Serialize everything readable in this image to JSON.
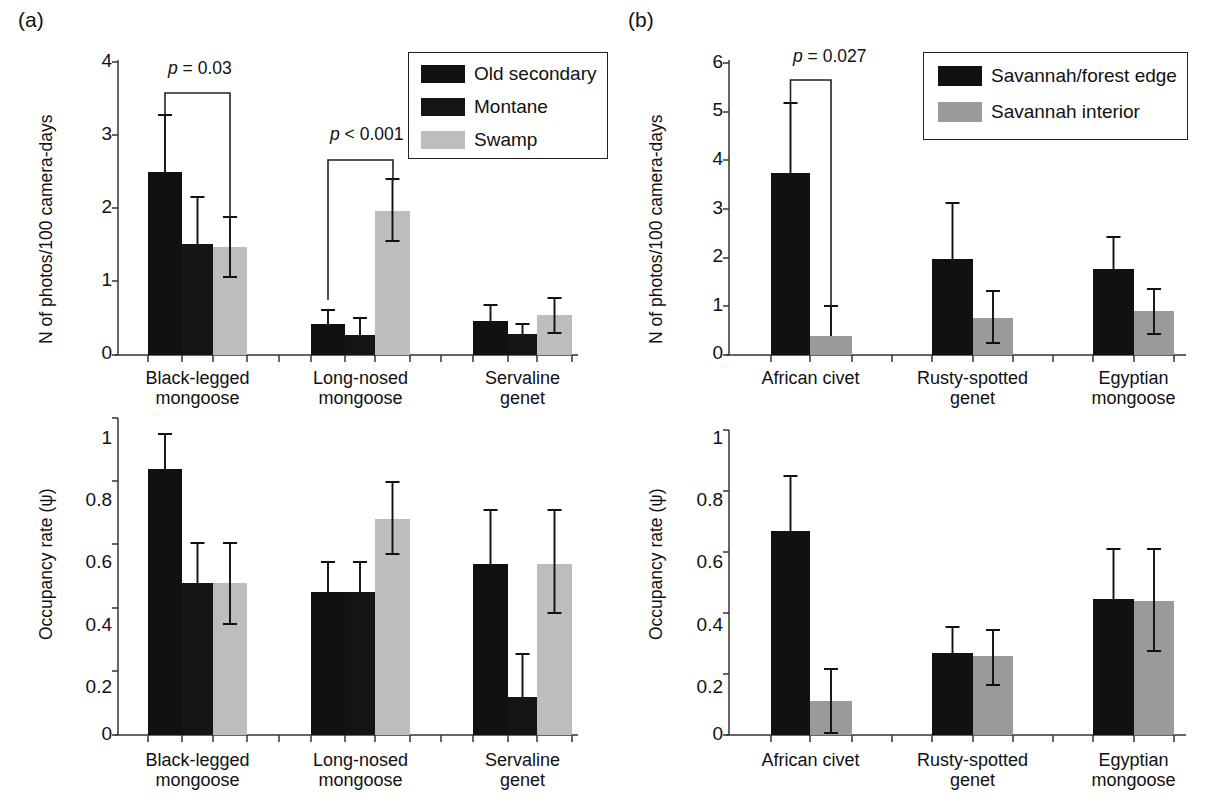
{
  "figure": {
    "panel_a_tag": "(a)",
    "panel_b_tag": "(b)",
    "axis_title_counts": "N of photos/100 camera-days",
    "axis_title_occupancy": "Occupancy rate (ψ)"
  },
  "legend_a": {
    "items": [
      {
        "label": "Old secondary",
        "color": "#111111"
      },
      {
        "label": "Montane",
        "color": "#151515"
      },
      {
        "label": "Swamp",
        "color": "#bdbdbd"
      }
    ]
  },
  "legend_b": {
    "items": [
      {
        "label": "Savannah/forest edge",
        "color": "#111111"
      },
      {
        "label": "Savannah interior",
        "color": "#9a9a9a"
      }
    ]
  },
  "annotations": {
    "a_top_p1_prefix": "p",
    "a_top_p1": "p = 0.03",
    "a_top_p2": "p < 0.001",
    "b_top_p1": "p = 0.027"
  },
  "ticks": {
    "a_top": [
      "0",
      "1",
      "2",
      "3",
      "4"
    ],
    "a_bottom": [
      "0",
      "0.2",
      "0.4",
      "0.6",
      "0.8",
      "1"
    ],
    "b_top": [
      "0",
      "1",
      "2",
      "3",
      "4",
      "5",
      "6"
    ],
    "b_bottom": [
      "0",
      "0.2",
      "0.4",
      "0.6",
      "0.8",
      "1"
    ]
  },
  "categories_a": [
    "Black-legged\nmongoose",
    "Long-nosed\nmongoose",
    "Servaline\ngenet"
  ],
  "categories_b": [
    "African civet",
    "Rusty-spotted\ngenet",
    "Egyptian\nmongoose"
  ],
  "chart_data": [
    {
      "id": "a-top",
      "type": "bar",
      "title": "(a) Photographic rate by forest habitat",
      "xlabel": "",
      "ylabel": "N of photos/100 camera-days",
      "ylim": [
        0,
        4
      ],
      "yticks": [
        0,
        1,
        2,
        3,
        4
      ],
      "grid": false,
      "legend_position": "top-right",
      "categories": [
        "Black-legged mongoose",
        "Long-nosed mongoose",
        "Servaline genet"
      ],
      "series": [
        {
          "name": "Old secondary",
          "color": "#111111",
          "values": [
            2.5,
            0.42,
            0.47
          ],
          "err_low": [
            2.5,
            0.42,
            0.47
          ],
          "err_high": [
            3.28,
            0.62,
            0.68
          ]
        },
        {
          "name": "Montane",
          "color": "#151515",
          "values": [
            1.52,
            0.27,
            0.28
          ],
          "err_low": [
            1.52,
            0.27,
            0.28
          ],
          "err_high": [
            2.15,
            0.51,
            0.42
          ]
        },
        {
          "name": "Swamp",
          "color": "#bdbdbd",
          "values": [
            1.47,
            1.97,
            0.55
          ],
          "err_low": [
            1.11,
            1.56,
            0.3
          ],
          "err_high": [
            1.89,
            2.4,
            0.78
          ]
        }
      ],
      "annotations": [
        {
          "text": "p = 0.03",
          "from": "Black-legged mongoose/Old secondary",
          "to": "Black-legged mongoose/Swamp"
        },
        {
          "text": "p < 0.001",
          "from": "Long-nosed mongoose/Old secondary",
          "to": "Long-nosed mongoose/Swamp"
        }
      ]
    },
    {
      "id": "a-bottom",
      "type": "bar",
      "title": "(a) Occupancy rate by forest habitat",
      "xlabel": "",
      "ylabel": "Occupancy rate (ψ)",
      "ylim": [
        0,
        1
      ],
      "yticks": [
        0,
        0.2,
        0.4,
        0.6,
        0.8,
        1
      ],
      "grid": false,
      "legend_position": "none",
      "categories": [
        "Black-legged mongoose",
        "Long-nosed mongoose",
        "Servaline genet"
      ],
      "series": [
        {
          "name": "Old secondary",
          "color": "#111111",
          "values": [
            0.84,
            0.45,
            0.54
          ],
          "err_low": [
            0.84,
            0.36,
            0.54
          ],
          "err_high": [
            0.95,
            0.545,
            0.71
          ]
        },
        {
          "name": "Montane",
          "color": "#151515",
          "values": [
            0.48,
            0.45,
            0.12
          ],
          "err_low": [
            0.48,
            0.36,
            0.12
          ],
          "err_high": [
            0.605,
            0.545,
            0.255
          ]
        },
        {
          "name": "Swamp",
          "color": "#bdbdbd",
          "values": [
            0.48,
            0.68,
            0.54
          ],
          "err_low": [
            0.35,
            0.57,
            0.385
          ],
          "err_high": [
            0.605,
            0.8,
            0.71
          ]
        }
      ],
      "annotations": []
    },
    {
      "id": "b-top",
      "type": "bar",
      "title": "(b) Photographic rate by savannah habitat",
      "xlabel": "",
      "ylabel": "N of photos/100 camera-days",
      "ylim": [
        0,
        6
      ],
      "yticks": [
        0,
        1,
        2,
        3,
        4,
        5,
        6
      ],
      "grid": false,
      "legend_position": "top-right",
      "categories": [
        "African civet",
        "Rusty-spotted genet",
        "Egyptian mongoose"
      ],
      "series": [
        {
          "name": "Savannah/forest edge",
          "color": "#111111",
          "values": [
            3.73,
            1.98,
            1.76
          ],
          "err_low": [
            3.73,
            1.98,
            1.76
          ],
          "err_high": [
            5.18,
            3.12,
            2.42
          ]
        },
        {
          "name": "Savannah interior",
          "color": "#9a9a9a",
          "values": [
            0.38,
            0.77,
            0.9
          ],
          "err_low": [
            0.38,
            0.25,
            0.44
          ],
          "err_high": [
            1.0,
            1.32,
            1.36
          ]
        }
      ],
      "annotations": [
        {
          "text": "p = 0.027",
          "from": "African civet/Savannah/forest edge",
          "to": "African civet/Savannah interior"
        }
      ]
    },
    {
      "id": "b-bottom",
      "type": "bar",
      "title": "(b) Occupancy rate by savannah habitat",
      "xlabel": "",
      "ylabel": "Occupancy rate (ψ)",
      "ylim": [
        0,
        1
      ],
      "yticks": [
        0,
        0.2,
        0.4,
        0.6,
        0.8,
        1
      ],
      "grid": false,
      "legend_position": "none",
      "categories": [
        "African civet",
        "Rusty-spotted genet",
        "Egyptian mongoose"
      ],
      "series": [
        {
          "name": "Savannah/forest edge",
          "color": "#111111",
          "values": [
            0.67,
            0.27,
            0.445
          ],
          "err_low": [
            0.67,
            0.205,
            0.445
          ],
          "err_high": [
            0.85,
            0.355,
            0.61
          ]
        },
        {
          "name": "Savannah interior",
          "color": "#9a9a9a",
          "values": [
            0.11,
            0.26,
            0.44
          ],
          "err_low": [
            0.005,
            0.165,
            0.275
          ],
          "err_high": [
            0.215,
            0.345,
            0.61
          ]
        }
      ],
      "annotations": []
    }
  ]
}
